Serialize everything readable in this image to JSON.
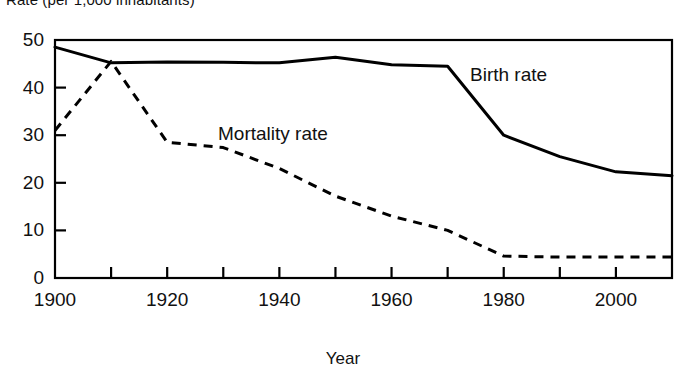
{
  "chart_data": {
    "type": "line",
    "title": "Rate (per 1,000 inhabitants)",
    "xlabel": "Year",
    "ylabel": "",
    "xlim": [
      1900,
      2010
    ],
    "ylim": [
      0,
      50
    ],
    "yticks": [
      "0",
      "10",
      "20",
      "30",
      "40",
      "50"
    ],
    "ytick_values": [
      0,
      10,
      20,
      30,
      40,
      50
    ],
    "xticks": [
      "1900",
      "1920",
      "1940",
      "1960",
      "1980",
      "2000"
    ],
    "xtick_values": [
      1900,
      1920,
      1940,
      1960,
      1980,
      2000
    ],
    "xtick_minor_step": 10,
    "grid": false,
    "legend_position": "inline-annotation",
    "x": [
      1900,
      1910,
      1920,
      1930,
      1940,
      1950,
      1960,
      1970,
      1980,
      1990,
      2000,
      2010
    ],
    "series": [
      {
        "name": "Birth rate",
        "style": "solid",
        "color": "#000000",
        "values": [
          48.5,
          45.2,
          45.4,
          45.3,
          45.2,
          46.4,
          44.8,
          44.5,
          30.0,
          25.5,
          22.3,
          21.5
        ]
      },
      {
        "name": "Mortality rate",
        "style": "dashed",
        "color": "#000000",
        "values": [
          31.0,
          45.5,
          28.5,
          27.4,
          23.0,
          17.2,
          13.0,
          10.0,
          4.6,
          4.4,
          4.4,
          4.4
        ]
      }
    ],
    "annotations": [
      {
        "text": "Birth rate",
        "x": 1970,
        "y": 42
      },
      {
        "text": "Mortality rate",
        "x": 1930,
        "y": 33
      }
    ]
  },
  "axes": {
    "y_ticks": [
      {
        "label": "50",
        "value": 50
      },
      {
        "label": "40",
        "value": 40
      },
      {
        "label": "30",
        "value": 30
      },
      {
        "label": "20",
        "value": 20
      },
      {
        "label": "10",
        "value": 10
      },
      {
        "label": "0",
        "value": 0
      }
    ],
    "x_ticks": [
      {
        "label": "1900",
        "value": 1900
      },
      {
        "label": "1920",
        "value": 1920
      },
      {
        "label": "1940",
        "value": 1940
      },
      {
        "label": "1960",
        "value": 1960
      },
      {
        "label": "1980",
        "value": 1980
      },
      {
        "label": "2000",
        "value": 2000
      }
    ]
  },
  "labels": {
    "title": "Rate (per 1,000 inhabitants)",
    "x_axis_title": "Year",
    "birth_series": "Birth rate",
    "mortality_series": "Mortality rate"
  }
}
